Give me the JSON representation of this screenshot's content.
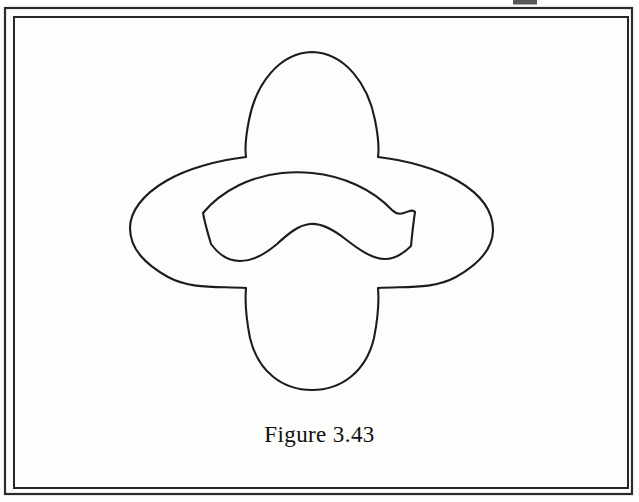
{
  "page": {
    "background_color": "#fdfdfc",
    "ink_color": "#1a1a1a",
    "width": 639,
    "height": 502
  },
  "frame": {
    "outer_border": {
      "x": 5,
      "y": 8,
      "width": 627,
      "height": 486,
      "stroke_color": "#2a2a2a",
      "stroke_width": 2.2
    },
    "inner_border": {
      "x": 14,
      "y": 17,
      "width": 614,
      "height": 471,
      "stroke_color": "#262626",
      "stroke_width": 2.0
    }
  },
  "figure": {
    "caption": "Figure 3.43",
    "caption_x": 320,
    "caption_y": 422,
    "outer_curve": {
      "name": "four-pointed-star-outline",
      "stroke_color": "#1c1c1c",
      "stroke_width": 2.1,
      "fill": "none",
      "key_points": {
        "top_apex": [
          312,
          52
        ],
        "upper_left_notch": [
          244,
          156
        ],
        "upper_right_notch": [
          378,
          157
        ],
        "left_tip": [
          130,
          228
        ],
        "right_tip": [
          493,
          230
        ],
        "lower_left_notch": [
          244,
          288
        ],
        "lower_right_notch": [
          378,
          288
        ],
        "bottom_apex": [
          312,
          390
        ]
      },
      "path": "M 312 52 C 345 53 368 84 375 120 C 379 140 379 150 378 157 C 404 160 436 168 458 181 C 482 195 493 212 493 230 C 493 249 479 264 456 277 C 432 290 404 286 378 288 C 379 300 378 318 374 338 C 366 372 341 390 312 390 C 283 390 258 372 250 338 C 246 318 245 300 246 288 C 220 286 192 290 168 277 C 145 264 130 249 130 228 C 130 212 142 195 166 181 C 188 168 220 160 246 157 C 245 150 245 140 249 120 C 256 84 279 53 312 52 Z"
    },
    "inner_curve": {
      "name": "boomerang-outline",
      "stroke_color": "#1c1c1c",
      "stroke_width": 2.1,
      "fill": "none",
      "key_points": {
        "top_arc_peak": [
          312,
          173
        ],
        "left_tip_upper": [
          203,
          213
        ],
        "left_tip_lower": [
          211,
          244
        ],
        "left_arm_dip": [
          240,
          261
        ],
        "inner_v_peak": [
          310,
          224
        ],
        "right_arm_dip": [
          385,
          259
        ],
        "right_tip_lower": [
          411,
          246
        ],
        "right_tip_upper": [
          415,
          212
        ]
      },
      "path": "M 203 213 C 222 190 252 176 282 173 C 292 172 303 172 312 173 C 343 176 372 189 392 210 C 402 220 410 206 415 212 C 413 225 412 236 411 246 C 403 254 395 259 385 259 C 372 259 358 249 344 238 C 331 228 320 223 310 224 C 299 225 289 233 277 244 C 263 256 251 261 240 261 C 229 261 219 255 211 244 C 208 234 205 224 203 213 Z"
    }
  },
  "artifacts": {
    "top_edge_smudge": {
      "name": "scan-smudge",
      "x": 513,
      "y": 0,
      "width": 24,
      "height": 5,
      "color": "#3a3a3a"
    }
  }
}
